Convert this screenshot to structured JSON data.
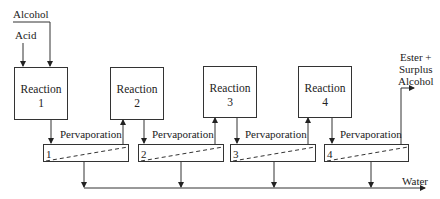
{
  "inputs": {
    "alcohol": "Alcohol",
    "acid": "Acid"
  },
  "reactors": [
    {
      "title": "Reaction",
      "number": "1"
    },
    {
      "title": "Reaction",
      "number": "2"
    },
    {
      "title": "Reaction",
      "number": "3"
    },
    {
      "title": "Reaction",
      "number": "4"
    }
  ],
  "pervaporation_units": [
    {
      "label": "Pervaporation",
      "number": "1"
    },
    {
      "label": "Pervaporation",
      "number": "2"
    },
    {
      "label": "Pervaporation",
      "number": "3"
    },
    {
      "label": "Pervaporation",
      "number": "4"
    }
  ],
  "outputs": {
    "product_line1": "Ester +",
    "product_line2": "Surplus",
    "product_line3": "Alcohol",
    "water": "Water"
  }
}
